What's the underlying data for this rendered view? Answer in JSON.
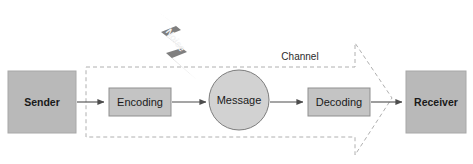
{
  "diagram": {
    "colors": {
      "endpoint_fill": "#b9b9b9",
      "endpoint_stroke": "#a8a8a8",
      "process_fill": "#c4c4c4",
      "process_stroke": "#8f8f8f",
      "message_fill": "#d2d2d2",
      "message_stroke": "#7d7d7d",
      "noise_fill": "#7f7f7f",
      "noise_text": "#f2f2f2",
      "arrow": "#4d4d4d",
      "dashed": "#b0b0b0",
      "text": "#1a1a1a",
      "background": "#ffffff"
    },
    "nodes": {
      "sender": {
        "label": "Sender",
        "shape": "rectangle"
      },
      "encoding": {
        "label": "Encoding",
        "shape": "rectangle"
      },
      "message": {
        "label": "Message",
        "shape": "circle"
      },
      "decoding": {
        "label": "Decoding",
        "shape": "rectangle"
      },
      "receiver": {
        "label": "Receiver",
        "shape": "rectangle"
      }
    },
    "annotations": {
      "channel": {
        "label": "Channel",
        "shape": "dashed-arrow"
      },
      "noise": {
        "label": "Noise",
        "shape": "lightning-bolt"
      }
    },
    "flow": [
      {
        "from": "Sender",
        "to": "Encoding"
      },
      {
        "from": "Encoding",
        "to": "Message"
      },
      {
        "from": "Message",
        "to": "Decoding"
      },
      {
        "from": "Decoding",
        "to": "Receiver"
      }
    ]
  }
}
